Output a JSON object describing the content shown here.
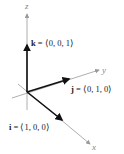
{
  "diagram": {
    "axes": [
      {
        "name": "x",
        "label": "x"
      },
      {
        "name": "y",
        "label": "y"
      },
      {
        "name": "z",
        "label": "z"
      }
    ],
    "vectors": [
      {
        "name": "i",
        "symbol": "i",
        "equals": " = ⟨1, 0, 0⟩",
        "components": [
          1,
          0,
          0
        ]
      },
      {
        "name": "j",
        "symbol": "j",
        "equals": " = ⟨0, 1, 0⟩",
        "components": [
          0,
          1,
          0
        ]
      },
      {
        "name": "k",
        "symbol": "k",
        "equals": " = ⟨0, 0, 1⟩",
        "components": [
          0,
          0,
          1
        ]
      }
    ],
    "colors": {
      "axis": "#999999",
      "vector": "#1a1a1a",
      "text": "#222222"
    }
  }
}
